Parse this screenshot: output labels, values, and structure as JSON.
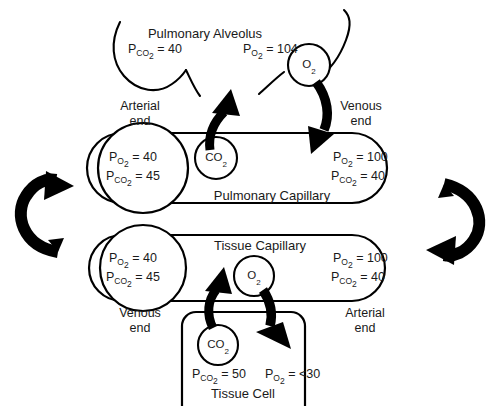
{
  "diagram": {
    "alveolus": {
      "name": "Pulmonary Alveolus",
      "pco2": "P<sub>CO₂</sub> = 40",
      "pco2_text": "PCO2 = 40",
      "po2": "P<sub>O₂</sub> = 104",
      "po2_text": "PO2 = 104"
    },
    "pulmonary_capillary": {
      "name": "Pulmonary Capillary",
      "arterial_end_label": "Arterial\nend",
      "arterial_end_line1": "Arterial",
      "arterial_end_line2": "end",
      "venous_end_line1": "Venous",
      "venous_end_line2": "end",
      "left_po2": "P<sub>O₂</sub> = 40",
      "left_pco2": "P<sub>CO₂</sub> = 45",
      "right_po2": "P<sub>O₂</sub> = 100",
      "right_pco2": "P<sub>CO₂</sub> = 40",
      "co2_bubble": "CO<sub>2</sub>",
      "o2_bubble": "O<sub>2</sub>"
    },
    "tissue_capillary": {
      "name": "Tissue Capillary",
      "venous_end_line1": "Venous",
      "venous_end_line2": "end",
      "arterial_end_line1": "Arterial",
      "arterial_end_line2": "end",
      "left_po2": "P<sub>O₂</sub> = 40",
      "left_pco2": "P<sub>CO₂</sub> = 45",
      "right_po2": "P<sub>O₂</sub> = 100",
      "right_pco2": "P<sub>CO₂</sub> = 40",
      "o2_bubble": "O<sub>2</sub>"
    },
    "tissue_cell": {
      "name": "Tissue Cell",
      "pco2": "P<sub>CO₂</sub> = 50",
      "po2": "P<sub>O₂</sub> = <30",
      "co2_bubble": "CO<sub>2</sub>"
    },
    "colors": {
      "stroke": "#000000",
      "background": "#ffffff",
      "text": "#1a1a1a"
    },
    "circulation": {
      "left_arrow": "systemic-return-arrow",
      "right_arrow": "systemic-outflow-arrow"
    }
  }
}
